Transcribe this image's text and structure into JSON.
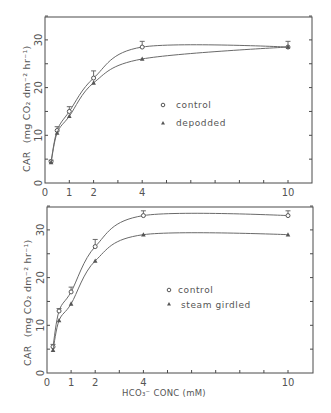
{
  "chart_data": [
    {
      "type": "line",
      "panel": "top",
      "title": "",
      "xlabel": "",
      "ylabel": "CAR  (mg CO2 dm-2 hr-1)",
      "x": [
        0.25,
        0.5,
        1,
        2,
        4,
        10
      ],
      "xticks": [
        0,
        1,
        2,
        4,
        10
      ],
      "xticklabels": [
        "0",
        "1",
        "2",
        "4",
        "10"
      ],
      "yticks": [
        0,
        10,
        20,
        30
      ],
      "yticklabels": [
        "0",
        "10",
        "20",
        "30"
      ],
      "xlim": [
        0,
        11
      ],
      "ylim": [
        0,
        35
      ],
      "grid": false,
      "legend_position": "center-right",
      "series": [
        {
          "name": "control",
          "marker": "circle",
          "values": [
            4.5,
            11,
            15,
            22,
            28.5,
            28.5
          ],
          "errors": [
            0.3,
            0.8,
            1,
            1.5,
            1.2,
            1.2
          ]
        },
        {
          "name": "depodded",
          "marker": "triangle",
          "values": [
            4.3,
            10.5,
            14,
            21,
            26,
            28.5
          ],
          "errors": [
            0,
            0,
            0,
            0,
            0,
            0
          ]
        }
      ]
    },
    {
      "type": "line",
      "panel": "bottom",
      "title": "",
      "xlabel": "HCO3- CONC (mM)",
      "ylabel": "CAR  (mg CO2 dm-2 hr-1)",
      "x": [
        0.25,
        0.5,
        1,
        2,
        4,
        10
      ],
      "xticks": [
        0,
        1,
        2,
        4,
        10
      ],
      "xticklabels": [
        "0",
        "1",
        "2",
        "4",
        "10"
      ],
      "yticks": [
        0,
        10,
        20,
        30
      ],
      "yticklabels": [
        "0",
        "10",
        "20",
        "30"
      ],
      "xlim": [
        0,
        11
      ],
      "ylim": [
        0,
        35
      ],
      "grid": false,
      "legend_position": "center-right",
      "series": [
        {
          "name": "control",
          "marker": "circle",
          "values": [
            5.5,
            13,
            17,
            26.5,
            33,
            33
          ],
          "errors": [
            0.5,
            0.5,
            1,
            1.5,
            1,
            1
          ]
        },
        {
          "name": "steam girdled",
          "marker": "triangle",
          "values": [
            4.8,
            11,
            14.5,
            23.5,
            29,
            29
          ],
          "errors": [
            0,
            0,
            0,
            0,
            0,
            0
          ]
        }
      ]
    }
  ],
  "panels": {
    "top": {
      "ylabel_main": "CAR",
      "ylabel_units": "(mg CO₂ dm⁻² hr⁻¹)",
      "legend": [
        "control",
        "depodded"
      ]
    },
    "bottom": {
      "ylabel_main": "CAR",
      "ylabel_units": "(mg CO₂ dm⁻² hr⁻¹)",
      "legend": [
        "control",
        "steam girdled"
      ],
      "xlabel": "HCO₃⁻  CONC   (mM)"
    }
  }
}
